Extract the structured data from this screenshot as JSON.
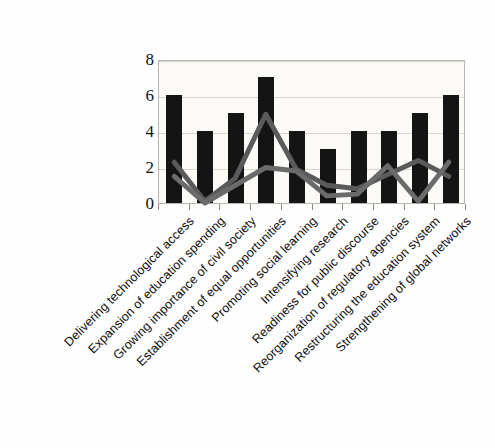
{
  "chart_data": {
    "type": "bar",
    "title": "",
    "subtitle": "",
    "xlabel": "",
    "ylabel": "",
    "ylim": [
      0,
      8
    ],
    "ytick_values": [
      0,
      2,
      4,
      6,
      8
    ],
    "ytick_labels": [
      "0",
      "2",
      "4",
      "6",
      "8"
    ],
    "grid": true,
    "legend": "none",
    "categories": [
      "Delivering technological access",
      "Expansion of education spending",
      "Growing importance of civil society",
      "Establishment of equal opportunities",
      "Promoting social learning",
      "Intensifying research",
      "Readiness for public discourse",
      "Reorganization of regulatory agencies",
      "Restructuring the education system",
      "Strengthening of global networks"
    ],
    "series": [
      {
        "name": "bars",
        "type": "bar",
        "color": "#141414",
        "values": [
          6,
          4,
          5,
          7,
          4,
          3,
          4,
          4,
          5,
          6
        ]
      },
      {
        "name": "line-upper",
        "type": "line",
        "color": "#5a5a5a",
        "values": [
          2.3,
          0.1,
          1.4,
          5.0,
          1.9,
          1.0,
          0.8,
          1.6,
          2.4,
          1.5
        ]
      },
      {
        "name": "line-lower",
        "type": "line",
        "color": "#6b6b6b",
        "values": [
          1.5,
          0.0,
          1.0,
          2.0,
          1.8,
          0.4,
          0.5,
          2.1,
          0.1,
          2.3
        ]
      }
    ]
  },
  "axis": {
    "y_max_label": "8",
    "y_min_label": "0"
  }
}
